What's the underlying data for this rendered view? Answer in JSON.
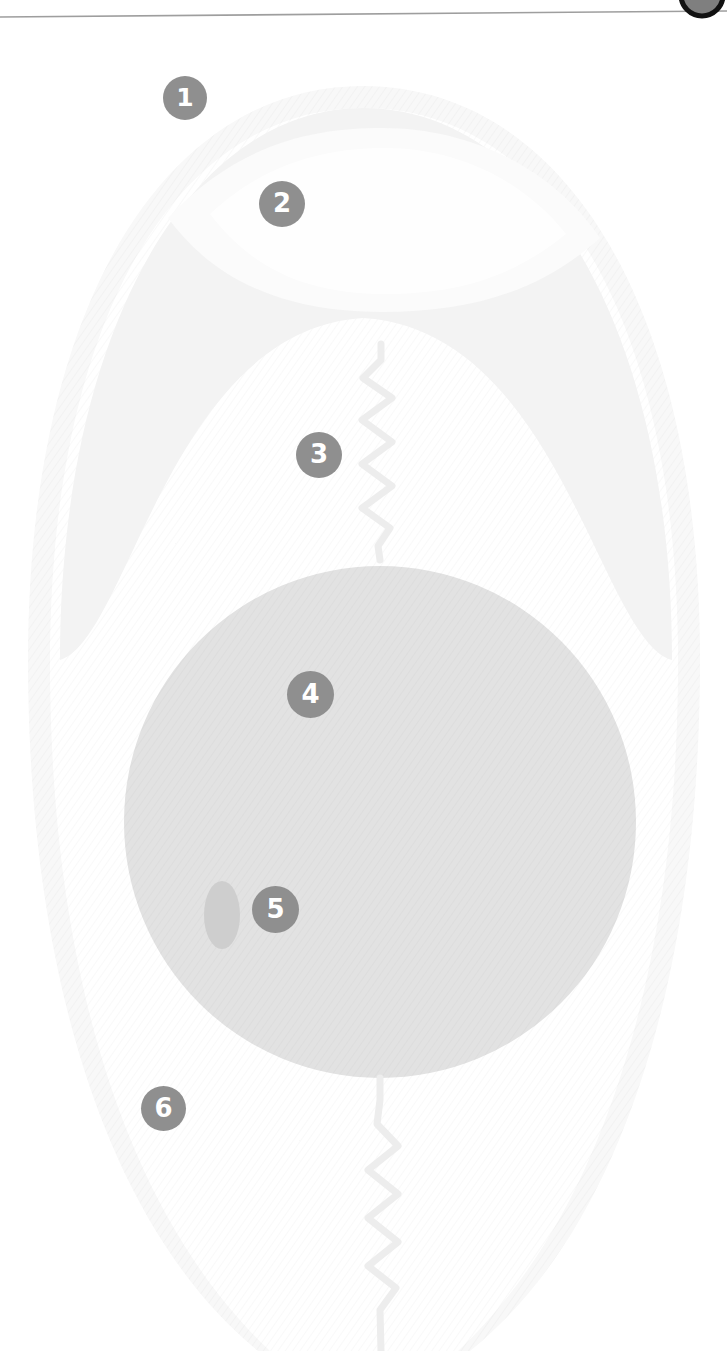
{
  "figure": {
    "kind": "anatomical-line-diagram",
    "background_color": "#ffffff",
    "canvas": {
      "width": 727,
      "height": 1351
    },
    "top_rule": {
      "name": "header-divider-line",
      "color": "#9a9a9a",
      "y_left": 17,
      "y_right": 12,
      "thickness": 1.6
    },
    "corner_badge": {
      "name": "corner-dark-disc",
      "fill": "#8a8a8a",
      "stroke": "#1a1a1a",
      "cx": 702,
      "cy": -4,
      "r": 20
    },
    "shapes": {
      "outer_body": {
        "name": "outer-oval-outline",
        "fill": "#f7f7f7",
        "description": "large faint vertical oval spanning most of the canvas"
      },
      "upper_lens": {
        "name": "upper-lens-region",
        "fill": "#f1f1f1",
        "description": "pointed-oval (lens) shaped region in the upper third"
      },
      "main_circle": {
        "name": "main-circle-region",
        "fill": "#e2e2e2",
        "cx": 380,
        "cy": 822,
        "r": 256
      },
      "small_oval": {
        "name": "small-inner-oval",
        "fill": "#cfcfcf",
        "cx": 222,
        "cy": 915,
        "rx": 18,
        "ry": 34
      },
      "upper_zigzag": {
        "name": "upper-zigzag-connector",
        "stroke": "#ededed",
        "width": 7,
        "from_y": 348,
        "to_y": 560
      },
      "lower_zigzag": {
        "name": "lower-zigzag-connector",
        "stroke": "#ededed",
        "width": 7,
        "from_y": 1085,
        "to_y": 1351
      }
    }
  },
  "markers": {
    "fill_color": "#8f8f8f",
    "text_color": "#ffffff",
    "items": [
      {
        "id": "m1",
        "label": "1",
        "name": "callout-marker-1",
        "x": 185,
        "y": 98
      },
      {
        "id": "m2",
        "label": "2",
        "name": "callout-marker-2",
        "x": 282,
        "y": 204
      },
      {
        "id": "m3",
        "label": "3",
        "name": "callout-marker-3",
        "x": 319,
        "y": 455
      },
      {
        "id": "m4",
        "label": "4",
        "name": "callout-marker-4",
        "x": 310,
        "y": 695
      },
      {
        "id": "m5",
        "label": "5",
        "name": "callout-marker-5",
        "x": 275,
        "y": 910
      },
      {
        "id": "m6",
        "label": "6",
        "name": "callout-marker-6",
        "x": 163,
        "y": 1109
      }
    ]
  }
}
